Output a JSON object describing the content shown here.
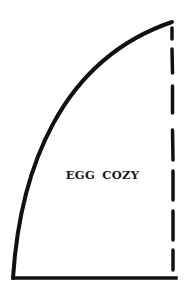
{
  "diagram": {
    "title": "EGG COZY",
    "type": "sewing-pattern-piece",
    "stroke_color": "#111111",
    "background_color": "#ffffff",
    "edges": [
      {
        "name": "curved-edge",
        "style": "solid",
        "from": [
          13,
          278
        ],
        "to": [
          172,
          23
        ]
      },
      {
        "name": "fold-line",
        "style": "dashed",
        "from": [
          172,
          23
        ],
        "to": [
          172,
          272
        ]
      },
      {
        "name": "bottom-edge",
        "style": "solid",
        "from": [
          13,
          278
        ],
        "to": [
          176,
          278
        ]
      }
    ]
  }
}
